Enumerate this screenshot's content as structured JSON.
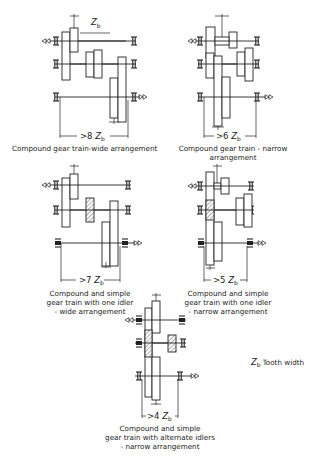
{
  "figure": {
    "legend": {
      "symbol": "Z",
      "subscript": "b",
      "text": "Tooth width"
    },
    "diagrams": [
      {
        "id": "compound-wide",
        "dimension": {
          "prefix": ">8",
          "symbol": "Z",
          "subscript": "b"
        },
        "caption": [
          "Compound gear train-wide arrangement"
        ],
        "top_dim_label": {
          "symbol": "Z",
          "subscript": "b"
        }
      },
      {
        "id": "compound-narrow",
        "dimension": {
          "prefix": ">6",
          "symbol": "Z",
          "subscript": "b"
        },
        "caption": [
          "Compound gear train - narrow",
          "arrangement"
        ]
      },
      {
        "id": "compound-simple-one-idler-wide",
        "dimension": {
          "prefix": ">7",
          "symbol": "Z",
          "subscript": "b"
        },
        "caption": [
          "Compound and simple",
          "gear train with one idler",
          "- wide arrangement"
        ]
      },
      {
        "id": "compound-simple-one-idler-narrow",
        "dimension": {
          "prefix": ">5",
          "symbol": "Z",
          "subscript": "b"
        },
        "caption": [
          "Compound and simple",
          "gear train with one idler",
          "- narrow arrangement"
        ]
      },
      {
        "id": "compound-simple-alternate-idlers-narrow",
        "dimension": {
          "prefix": ">4",
          "symbol": "Z",
          "subscript": "b"
        },
        "caption": [
          "Compound and simple",
          "gear train with alternate idlers",
          "- narrow arrangement"
        ]
      }
    ]
  }
}
